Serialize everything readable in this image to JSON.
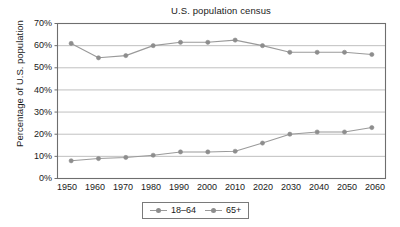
{
  "chart_data": {
    "type": "line",
    "title": "U.S. population census",
    "xlabel": "",
    "ylabel": "Percentage of U.S. population",
    "categories": [
      "1950",
      "1960",
      "1970",
      "1980",
      "1990",
      "2000",
      "2010",
      "2020",
      "2030",
      "2040",
      "2050",
      "2060"
    ],
    "ylim": [
      0,
      70
    ],
    "ytick_labels": [
      "0%",
      "10%",
      "20%",
      "30%",
      "40%",
      "50%",
      "60%",
      "70%"
    ],
    "ytick_values": [
      0,
      10,
      20,
      30,
      40,
      50,
      60,
      70
    ],
    "grid": "horizontal",
    "legend_position": "bottom-center",
    "series": [
      {
        "name": "18–64",
        "color": "#9a9a9a",
        "marker": "circle",
        "values": [
          61,
          54.5,
          55.5,
          60,
          61.5,
          61.5,
          62.5,
          60,
          57,
          57,
          57,
          56
        ]
      },
      {
        "name": "65+",
        "color": "#9a9a9a",
        "marker": "circle",
        "values": [
          8,
          9,
          9.5,
          10.5,
          12,
          12,
          12.3,
          16,
          20,
          21,
          21,
          23
        ]
      }
    ]
  },
  "legend": {
    "entries": [
      {
        "label": "18–64"
      },
      {
        "label": "65+"
      }
    ]
  },
  "colors": {
    "line": "#9a9a9a",
    "marker": "#8d8d8d",
    "grid": "#b9b9b9",
    "frame": "#6e6e6e",
    "text": "#1a1a1a",
    "background": "#ffffff"
  }
}
